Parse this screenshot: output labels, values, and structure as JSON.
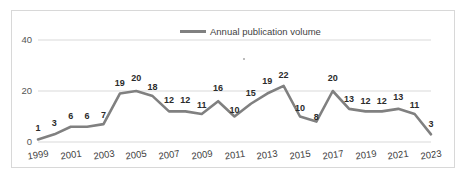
{
  "chart_data": {
    "type": "line",
    "title": "",
    "xlabel": "",
    "ylabel": "",
    "legend": [
      "Annual publication volume"
    ],
    "legend_position": "top-center",
    "grid": true,
    "ylim": [
      0,
      40
    ],
    "yticks": [
      0,
      20,
      40
    ],
    "xticks": [
      "1999",
      "2001",
      "2003",
      "2005",
      "2007",
      "2009",
      "2011",
      "2013",
      "2015",
      "2017",
      "2019",
      "2021",
      "2023"
    ],
    "x": [
      1999,
      2000,
      2001,
      2002,
      2003,
      2004,
      2005,
      2006,
      2007,
      2008,
      2009,
      2010,
      2011,
      2012,
      2013,
      2014,
      2015,
      2016,
      2017,
      2018,
      2019,
      2020,
      2021,
      2022,
      2023
    ],
    "series": [
      {
        "name": "Annual publication volume",
        "color": "#808080",
        "values": [
          1,
          3,
          6,
          6,
          7,
          19,
          20,
          18,
          12,
          12,
          11,
          16,
          10,
          15,
          19,
          22,
          10,
          8,
          20,
          13,
          12,
          12,
          13,
          11,
          3
        ]
      }
    ],
    "data_labels": [
      "1",
      "3",
      "6",
      "6",
      "7",
      "19",
      "20",
      "18",
      "12",
      "12",
      "11",
      "16",
      "10",
      "15",
      "19",
      "22",
      "10",
      "8",
      "20",
      "13",
      "12",
      "12",
      "13",
      "11",
      "3"
    ]
  },
  "colors": {
    "line": "#808080",
    "grid": "#d9d9d9",
    "frame": "#d8d8d8",
    "text": "#3f3f3f",
    "background": "#ffffff"
  }
}
